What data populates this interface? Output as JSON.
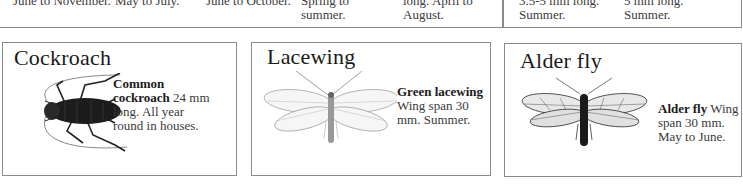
{
  "top_row": {
    "cells": [
      {
        "partial_line": "",
        "last_line": "June to November."
      },
      {
        "partial_line": "",
        "last_line": "May to July."
      },
      {
        "partial_line": "",
        "last_line": "June to October."
      },
      {
        "partial_line": "Spring to",
        "last_line": "summer."
      },
      {
        "partial_line": "long. April to",
        "last_line": "August."
      },
      {
        "partial_line": "3.5-5 mm long.",
        "last_line": "Summer."
      },
      {
        "partial_line": "5 mm long.",
        "last_line": "Summer."
      }
    ]
  },
  "panels": [
    {
      "title": "Cockroach",
      "name_bold": "Common cockroach",
      "name_bold_line1": "Common",
      "name_bold_line2": "cockroach",
      "detail_inline": " 24 mm",
      "detail_line2": "long. All year",
      "detail_line3": "round in houses.",
      "illustration": "cockroach-illustration"
    },
    {
      "title": "Lacewing",
      "name_bold": "Green lacewing",
      "detail_line1": "Wing span 30",
      "detail_line2": "mm. Summer.",
      "illustration": "lacewing-illustration"
    },
    {
      "title": "Alder fly",
      "name_bold": "Alder fly",
      "detail_inline": " Wing",
      "detail_line2": "span 30 mm.",
      "detail_line3": "May to June.",
      "illustration": "alder-fly-illustration"
    }
  ]
}
